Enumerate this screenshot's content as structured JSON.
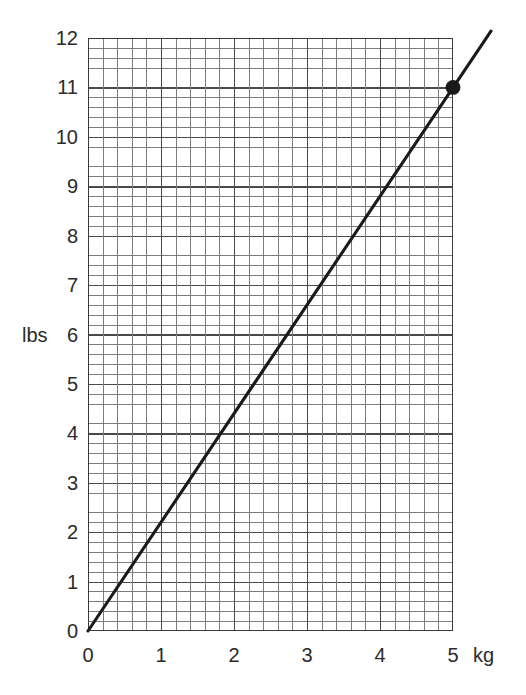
{
  "chart_data": {
    "type": "line",
    "title": "",
    "subtitle": "",
    "xlabel": "kg",
    "ylabel": "lbs",
    "xlim": [
      0,
      5
    ],
    "ylim": [
      0,
      12
    ],
    "x_ticks": [
      0,
      1,
      2,
      3,
      4,
      5
    ],
    "y_ticks": [
      0,
      1,
      2,
      3,
      4,
      5,
      6,
      7,
      8,
      9,
      10,
      11,
      12
    ],
    "x_tick_labels": [
      "0",
      "1",
      "2",
      "3",
      "4",
      "5"
    ],
    "y_tick_labels": [
      "0",
      "1",
      "2",
      "3",
      "4",
      "5",
      "6",
      "7",
      "8",
      "9",
      "10",
      "11",
      "12"
    ],
    "grid": true,
    "grid_major_step_x": 1,
    "grid_major_step_y": 1,
    "grid_minor_divisions": 5,
    "legend": false,
    "legend_position": "none",
    "series": [
      {
        "name": "kg to lbs conversion",
        "type": "line",
        "x": [
          0,
          5
        ],
        "values": [
          0,
          11
        ],
        "slope": 2.2,
        "intercept": 0,
        "extends_beyond_axes": true,
        "x_draw_range": [
          0,
          5.52
        ],
        "y_draw_range": [
          0,
          12.14
        ]
      }
    ],
    "markers": [
      {
        "label": "",
        "x": 5,
        "y": 11,
        "shape": "filled-circle"
      }
    ],
    "annotations": []
  },
  "axes": {
    "y_axis_name": "lbs",
    "y_axis_name_at_value": 6,
    "x_axis_name": "kg"
  },
  "colors": {
    "background": "#ffffff",
    "grid_major": "#4a4a4a",
    "grid_minor": "#7d7d7d",
    "axis_border": "#3a3a3a",
    "data_line": "#1a1a1a",
    "marker_fill": "#1a1a1a",
    "tick_text": "#2b2b2b"
  }
}
